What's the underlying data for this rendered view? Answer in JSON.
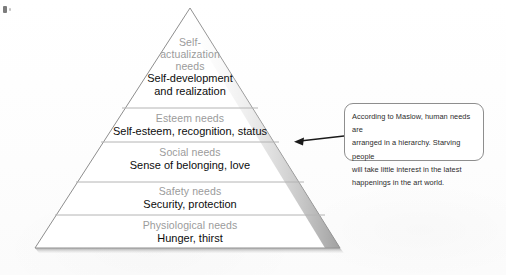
{
  "figure": {
    "type": "maslow-hierarchy-of-needs-pyramid",
    "tiers": [
      {
        "id": "self-actualization",
        "heading": "Self-\nactualization\nneeds",
        "heading_lines": [
          "Self-",
          "actualization",
          "needs"
        ],
        "description": "Self-development\nand realization",
        "description_lines": [
          "Self-development",
          "and realization"
        ]
      },
      {
        "id": "esteem",
        "heading": "Esteem needs",
        "heading_lines": [
          "Esteem needs"
        ],
        "description": "Self-esteem, recognition, status",
        "description_lines": [
          "Self-esteem, recognition, status"
        ]
      },
      {
        "id": "social",
        "heading": "Social needs",
        "heading_lines": [
          "Social needs"
        ],
        "description": "Sense of belonging, love",
        "description_lines": [
          "Sense of belonging, love"
        ]
      },
      {
        "id": "safety",
        "heading": "Safety needs",
        "heading_lines": [
          "Safety needs"
        ],
        "description": "Security, protection",
        "description_lines": [
          "Security, protection"
        ]
      },
      {
        "id": "physiological",
        "heading": "Physiological needs",
        "heading_lines": [
          "Physiological needs"
        ],
        "description": "Hunger, thirst",
        "description_lines": [
          "Hunger, thirst"
        ]
      }
    ]
  },
  "callout": {
    "text": "According to Maslow, human needs are arranged in a hierarchy. Starving people will take little interest in the latest happenings in the art world.",
    "lines": [
      "According to Maslow, human needs are",
      "arranged in a hierarchy. Starving people",
      "will take little interest in the latest",
      "happenings in the art world."
    ],
    "points_to": "esteem"
  },
  "colors": {
    "heading_gray": "#9b9b9b",
    "body_black": "#0d0d0d",
    "outline": "#8e8e8e",
    "divider": "#b4b4b4",
    "page": "#ffffff"
  }
}
